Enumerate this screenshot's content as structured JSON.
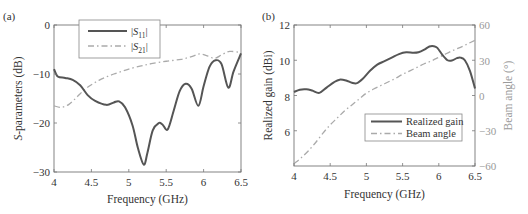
{
  "chart_data": [
    {
      "panel": "(a)",
      "type": "line",
      "title": "",
      "xlabel": "Frequency (GHz)",
      "ylabel": "S-parameters (dB)",
      "xlim": [
        4,
        6.5
      ],
      "ylim": [
        -30,
        0
      ],
      "xticks": [
        "4",
        "4.5",
        "5",
        "5.5",
        "6",
        "6.5"
      ],
      "yticks": [
        "0",
        "−10",
        "−20",
        "−30"
      ],
      "grid": false,
      "legend_position": "upper-left-inside",
      "series": [
        {
          "name": "|S11|",
          "style": "solid",
          "color": "#555555",
          "x": [
            4.0,
            4.05,
            4.15,
            4.25,
            4.35,
            4.45,
            4.55,
            4.7,
            4.8,
            4.87,
            4.95,
            5.05,
            5.12,
            5.2,
            5.25,
            5.32,
            5.4,
            5.45,
            5.52,
            5.6,
            5.68,
            5.76,
            5.84,
            5.93,
            6.0,
            6.08,
            6.16,
            6.24,
            6.33,
            6.4,
            6.5
          ],
          "values": [
            -9,
            -10.5,
            -10.8,
            -11.2,
            -12.3,
            -14.3,
            -15.5,
            -16.3,
            -15.8,
            -15.6,
            -16.8,
            -20.5,
            -25,
            -28.5,
            -26,
            -21.5,
            -20,
            -20.3,
            -21.3,
            -17.5,
            -13.5,
            -12,
            -13,
            -16.5,
            -12.5,
            -8.5,
            -7.2,
            -8,
            -12.8,
            -9.5,
            -5.8
          ]
        },
        {
          "name": "|S21|",
          "style": "dash-dot",
          "color": "#aaaaaa",
          "x": [
            4.0,
            4.1,
            4.2,
            4.3,
            4.4,
            4.5,
            4.6,
            4.7,
            4.8,
            4.9,
            5.0,
            5.15,
            5.3,
            5.5,
            5.7,
            5.85,
            5.95,
            6.05,
            6.15,
            6.25,
            6.35,
            6.5
          ],
          "values": [
            -16.5,
            -16.8,
            -16.2,
            -14.8,
            -13.3,
            -12.2,
            -11.3,
            -10.6,
            -10,
            -9.5,
            -9,
            -8.4,
            -7.9,
            -7.4,
            -7,
            -6.4,
            -5.9,
            -6.3,
            -6.8,
            -6,
            -5.4,
            -5.6
          ]
        }
      ]
    },
    {
      "panel": "(b)",
      "type": "line",
      "title": "",
      "xlabel": "Frequency (GHz)",
      "ylabel": "Realized gain (dBi)",
      "y2label": "Beam angle (°)",
      "xlim": [
        4,
        6.5
      ],
      "ylim": [
        4,
        12
      ],
      "y2lim": [
        -60,
        60
      ],
      "xticks": [
        "4",
        "4.5",
        "5",
        "5.5",
        "6",
        "6.5"
      ],
      "yticks": [
        "6",
        "8",
        "10",
        "12"
      ],
      "y2ticks": [
        "−60",
        "−30",
        "0",
        "30",
        "60"
      ],
      "grid": false,
      "legend_position": "lower-right-inside",
      "series": [
        {
          "name": "Realized gain",
          "axis": "left",
          "style": "solid",
          "color": "#555555",
          "x": [
            4.0,
            4.08,
            4.17,
            4.25,
            4.35,
            4.45,
            4.55,
            4.63,
            4.72,
            4.8,
            4.87,
            4.95,
            5.05,
            5.15,
            5.25,
            5.35,
            5.45,
            5.55,
            5.65,
            5.72,
            5.8,
            5.87,
            5.93,
            5.98,
            6.05,
            6.12,
            6.18,
            6.25,
            6.3,
            6.36,
            6.43,
            6.5
          ],
          "values": [
            8.2,
            8.33,
            8.35,
            8.28,
            8.15,
            8.45,
            8.75,
            8.9,
            8.85,
            8.72,
            8.7,
            8.95,
            9.4,
            9.75,
            9.95,
            10.15,
            10.35,
            10.45,
            10.42,
            10.45,
            10.6,
            10.78,
            10.8,
            10.7,
            10.3,
            10.0,
            9.98,
            10.12,
            10.15,
            10.0,
            9.4,
            8.4
          ]
        },
        {
          "name": "Beam angle",
          "axis": "right",
          "style": "dash-dot",
          "color": "#aaaaaa",
          "x": [
            4.0,
            4.1,
            4.2,
            4.3,
            4.4,
            4.5,
            4.6,
            4.7,
            4.8,
            4.9,
            5.0,
            5.1,
            5.2,
            5.3,
            5.4,
            5.5,
            5.6,
            5.7,
            5.8,
            5.9,
            6.0,
            6.1,
            6.2,
            6.3,
            6.4,
            6.5
          ],
          "values": [
            -58,
            -53,
            -47,
            -40,
            -32,
            -25,
            -19,
            -13,
            -8,
            -3,
            2,
            5.5,
            8.5,
            11.5,
            14.5,
            18,
            21,
            24,
            27,
            29.5,
            32.5,
            35.5,
            38.5,
            41,
            44,
            47
          ]
        }
      ]
    }
  ],
  "panel_a": {
    "label": "(a)",
    "xlabel": "Frequency (GHz)",
    "ylabel_italic": "S",
    "ylabel_rest": "-parameters (dB)",
    "xticks": [
      "4",
      "4.5",
      "5",
      "5.5",
      "6",
      "6.5"
    ],
    "yticks": [
      "0",
      "−10",
      "−20",
      "−30"
    ],
    "legend": {
      "s11_pre": "|",
      "s11_sym": "S",
      "s11_sub": "11",
      "s11_post": "|",
      "s21_pre": "|",
      "s21_sym": "S",
      "s21_sub": "21",
      "s21_post": "|"
    }
  },
  "panel_b": {
    "label": "(b)",
    "xlabel": "Frequency (GHz)",
    "ylabel": "Realized gain (dBi)",
    "y2label": "Beam angle (°)",
    "xticks": [
      "4",
      "4.5",
      "5",
      "5.5",
      "6",
      "6.5"
    ],
    "yticks": [
      "6",
      "8",
      "10",
      "12"
    ],
    "y2ticks": [
      "−60",
      "−30",
      "0",
      "30",
      "60"
    ],
    "legend": {
      "gain": "Realized gain",
      "beam": "Beam angle"
    }
  },
  "colors": {
    "axis": "#666666",
    "primary_line": "#555555",
    "secondary_line": "#aaaaaa",
    "secondary_axis_text": "#9a9a9a"
  }
}
